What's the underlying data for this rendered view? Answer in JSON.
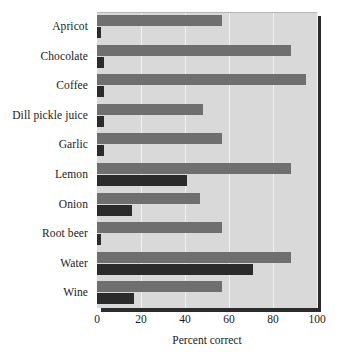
{
  "chart_data": {
    "type": "bar",
    "orientation": "horizontal",
    "title": "",
    "xlabel": "Percent correct",
    "ylabel": "",
    "xlim": [
      0,
      100
    ],
    "xticks": [
      0,
      20,
      40,
      60,
      80,
      100
    ],
    "xtick_labels": [
      "0",
      "20",
      "40",
      "60",
      "80",
      "100"
    ],
    "grid": true,
    "grid_axis": "x",
    "legend": false,
    "legend_position": "none",
    "categories": [
      "Apricot",
      "Chocolate",
      "Coffee",
      "Dill pickle juice",
      "Garlic",
      "Lemon",
      "Onion",
      "Root beer",
      "Water",
      "Wine"
    ],
    "series": [
      {
        "name": "light-bar",
        "color": "#6f6f6f",
        "values": [
          57,
          88,
          95,
          48,
          57,
          88,
          47,
          57,
          88,
          57
        ]
      },
      {
        "name": "dark-bar",
        "color": "#2b2b2b",
        "values": [
          2,
          3,
          3,
          3,
          3,
          41,
          16,
          2,
          71,
          17
        ]
      }
    ]
  },
  "style": {
    "plot_background": "#d9d9d9",
    "gridline_color": "#f2f2f2",
    "frame_shadow_color": "#2b2b2b",
    "page_background": "#ffffff",
    "text_color": "#1a1a1a"
  }
}
